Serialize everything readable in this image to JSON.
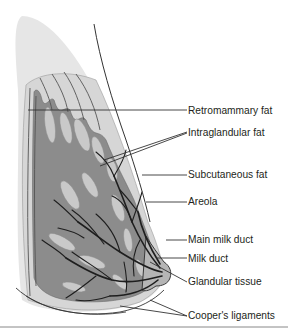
{
  "figure": {
    "colors": {
      "skin_fill": "#e6e6e6",
      "subcutaneous_fat": "#d8d8d8",
      "glandular_tissue": "#8c8c8c",
      "fat_lobules": "#c9c9c9",
      "ducts": "#1e1e1e",
      "leader_lines": "#333333",
      "text": "#231f20"
    },
    "labels": [
      {
        "id": "retromammary-fat",
        "text": "Retromammary fat"
      },
      {
        "id": "intraglandular-fat",
        "text": "Intraglandular fat"
      },
      {
        "id": "subcutaneous-fat",
        "text": "Subcutaneous fat"
      },
      {
        "id": "areola",
        "text": "Areola"
      },
      {
        "id": "main-milk-duct",
        "text": "Main milk duct"
      },
      {
        "id": "milk-duct",
        "text": "Milk duct"
      },
      {
        "id": "glandular-tissue",
        "text": "Glandular tissue"
      },
      {
        "id": "coopers-ligaments",
        "text": "Cooper's ligaments"
      }
    ]
  }
}
